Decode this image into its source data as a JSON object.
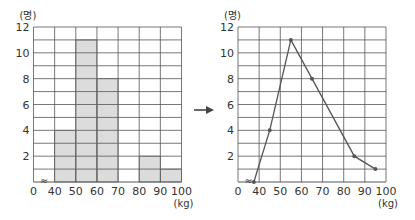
{
  "chart_data": [
    {
      "type": "bar",
      "subtype": "histogram",
      "title": "",
      "xlabel": "(kg)",
      "ylabel": "(명)",
      "x_ticks": [
        "0",
        "40",
        "50",
        "60",
        "70",
        "80",
        "90",
        "100"
      ],
      "y_ticks": [
        "2",
        "4",
        "6",
        "8",
        "10",
        "12"
      ],
      "categories": [
        "40-50",
        "50-60",
        "60-70",
        "70-80",
        "80-90",
        "90-100"
      ],
      "values": [
        4,
        11,
        8,
        0,
        2,
        1
      ],
      "ylim": [
        0,
        12
      ],
      "xlim": [
        40,
        100
      ],
      "axis_break": true,
      "grid": true,
      "bar_color": "#dcdcdc"
    },
    {
      "type": "line",
      "subtype": "frequency polygon",
      "title": "",
      "xlabel": "(kg)",
      "ylabel": "(명)",
      "x_ticks": [
        "0",
        "40",
        "50",
        "60",
        "70",
        "80",
        "90",
        "100"
      ],
      "y_ticks": [
        "2",
        "4",
        "6",
        "8",
        "10",
        "12"
      ],
      "x": [
        35,
        45,
        55,
        65,
        85,
        95
      ],
      "values": [
        0,
        4,
        11,
        8,
        2,
        1
      ],
      "ylim": [
        0,
        12
      ],
      "xlim": [
        40,
        100
      ],
      "axis_break": true,
      "grid": true,
      "line_color": "#555555"
    }
  ],
  "arrow": {
    "icon": "right-arrow-icon"
  },
  "labels": {
    "left_unit_y": "(명)",
    "left_unit_x": "(kg)",
    "right_unit_y": "(명)",
    "right_unit_x": "(kg)",
    "break_mark": "≈"
  }
}
